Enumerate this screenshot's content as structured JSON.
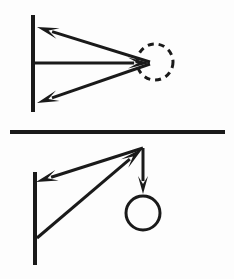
{
  "figure": {
    "canvas": {
      "width": 234,
      "height": 279,
      "background": "#fdfdfd"
    },
    "ink_color": "#1a1a1a"
  },
  "divider": {
    "name": "horizontal-rule",
    "x1": 10,
    "y1": 132,
    "x2": 225,
    "y2": 132,
    "thickness": 4
  },
  "panels": [
    {
      "id": "top-panel",
      "label": "Upper diagram: three vectors converging at a dashed circle",
      "wall": {
        "name": "vertical-wall-line",
        "x1": 33,
        "y1": 15,
        "x2": 33,
        "y2": 112,
        "thickness": 4
      },
      "target": {
        "name": "dashed-circle",
        "cx": 155,
        "cy": 62,
        "r": 18,
        "thickness": 3,
        "dash": "6 5",
        "style": "dashed",
        "fill": "none"
      },
      "vectors": [
        {
          "name": "upper-left-arrow",
          "from_x": 150,
          "from_y": 62,
          "to_x": 37,
          "to_y": 27,
          "direction": "left-up",
          "head_at": "to",
          "thickness": 3,
          "head_length": 22,
          "head_width": 11
        },
        {
          "name": "horizontal-right-arrow",
          "from_x": 34,
          "from_y": 63,
          "to_x": 150,
          "to_y": 63,
          "direction": "right",
          "head_at": "to",
          "thickness": 3,
          "head_length": 22,
          "head_width": 11
        },
        {
          "name": "lower-left-arrow",
          "from_x": 150,
          "from_y": 64,
          "to_x": 37,
          "to_y": 103,
          "direction": "left-down",
          "head_at": "to",
          "thickness": 3,
          "head_length": 22,
          "head_width": 11
        }
      ]
    },
    {
      "id": "bottom-panel",
      "label": "Lower diagram: bracket arm with suspended mass circle",
      "wall": {
        "name": "vertical-wall-line",
        "x1": 35,
        "y1": 172,
        "x2": 35,
        "y2": 265,
        "thickness": 4
      },
      "target": {
        "name": "mass-circle",
        "cx": 143,
        "cy": 213,
        "r": 17,
        "thickness": 3,
        "style": "solid",
        "fill": "none"
      },
      "apex": {
        "x": 143,
        "y": 148
      },
      "vectors": [
        {
          "name": "apex-to-wall-arrow",
          "from_x": 143,
          "from_y": 148,
          "to_x": 36,
          "to_y": 182,
          "direction": "left-down",
          "head_at": "to",
          "thickness": 3,
          "head_length": 22,
          "head_width": 11
        },
        {
          "name": "wall-base-to-apex-arrow",
          "from_x": 37,
          "from_y": 238,
          "to_x": 143,
          "to_y": 148,
          "direction": "right-up",
          "head_at": "to",
          "thickness": 3,
          "head_length": 24,
          "head_width": 11
        },
        {
          "name": "apex-down-arrow",
          "from_x": 143,
          "from_y": 148,
          "to_x": 143,
          "to_y": 194,
          "direction": "down",
          "head_at": "to",
          "thickness": 3,
          "head_length": 18,
          "head_width": 10
        }
      ]
    }
  ]
}
